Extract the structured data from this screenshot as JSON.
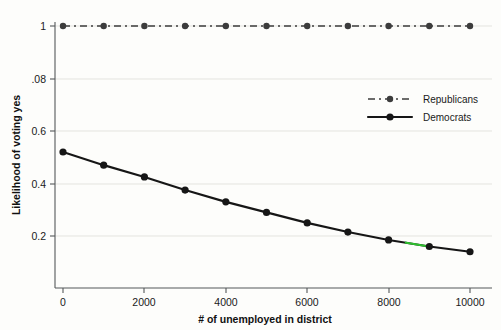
{
  "chart_data": {
    "type": "line",
    "title": "",
    "xlabel": "# of unemployed in district",
    "ylabel": "Likelihood of voting yes",
    "x": [
      0,
      1000,
      2000,
      3000,
      4000,
      5000,
      6000,
      7000,
      8000,
      9000,
      10000
    ],
    "xlim": [
      0,
      10000
    ],
    "ylim": [
      0.1,
      1.04
    ],
    "grid": true,
    "legend_position": "upper right",
    "xticks": [
      "0",
      "2000",
      "4000",
      "6000",
      "8000",
      "10000"
    ],
    "xtick_values": [
      0,
      2000,
      4000,
      6000,
      8000,
      10000
    ],
    "yticks": [
      "0.2",
      "0.4",
      "0.6",
      ".08",
      "1"
    ],
    "ytick_values": [
      0.2,
      0.4,
      0.6,
      0.8,
      1.0
    ],
    "series": [
      {
        "name": "Republicans",
        "style": "dashed",
        "color": "#3c3c3c",
        "values": [
          1,
          1,
          1,
          1,
          1,
          1,
          1,
          1,
          1,
          1,
          1
        ]
      },
      {
        "name": "Democrats",
        "style": "solid",
        "color": "#161616",
        "values": [
          0.52,
          0.47,
          0.425,
          0.375,
          0.33,
          0.29,
          0.25,
          0.215,
          0.185,
          0.16,
          0.14
        ]
      }
    ],
    "annotations": [
      {
        "name": "green-highlight-segment",
        "color": "#2ec02e",
        "x_start": 8400,
        "x_end": 8950
      }
    ]
  },
  "legend": {
    "items": [
      {
        "label": "Republicans",
        "marker": "circle",
        "line": "dashed"
      },
      {
        "label": "Democrats",
        "marker": "circle",
        "line": "solid"
      }
    ]
  },
  "axes": {
    "y_title": "Likelihood of voting yes",
    "x_title": "# of unemployed in district"
  }
}
